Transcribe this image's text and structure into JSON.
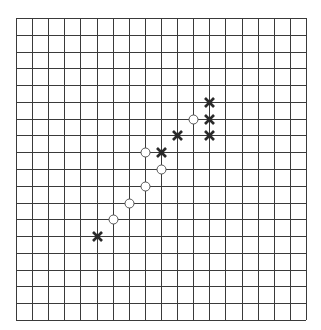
{
  "board": {
    "type": "gomoku-grid",
    "cols": 18,
    "rows": 18,
    "origin": {
      "x": 16,
      "y": 18
    },
    "size": {
      "width": 290,
      "height": 302
    },
    "line_color": "#3a3a3a",
    "background": "#ffffff"
  },
  "pieces": {
    "x_color": "#2a2a2a",
    "o_color": "#555555",
    "items": [
      {
        "type": "X",
        "col": 5,
        "row": 13
      },
      {
        "type": "O",
        "col": 6,
        "row": 12
      },
      {
        "type": "O",
        "col": 7,
        "row": 11
      },
      {
        "type": "O",
        "col": 8,
        "row": 10
      },
      {
        "type": "O",
        "col": 9,
        "row": 9
      },
      {
        "type": "O",
        "col": 8,
        "row": 8
      },
      {
        "type": "X",
        "col": 9,
        "row": 8
      },
      {
        "type": "X",
        "col": 10,
        "row": 7
      },
      {
        "type": "O",
        "col": 11,
        "row": 6
      },
      {
        "type": "X",
        "col": 12,
        "row": 6
      },
      {
        "type": "X",
        "col": 12,
        "row": 5
      },
      {
        "type": "X",
        "col": 12,
        "row": 7
      }
    ]
  }
}
